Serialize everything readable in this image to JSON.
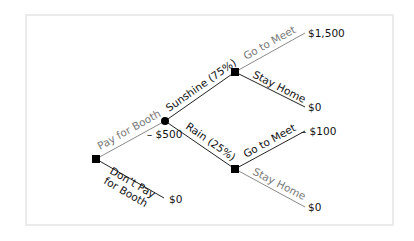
{
  "diagram": {
    "type": "decision-tree",
    "nodes": {
      "root": {
        "kind": "decision",
        "shape": "square"
      },
      "weather": {
        "kind": "chance",
        "shape": "circle"
      },
      "sunshine_choice": {
        "kind": "decision",
        "shape": "square"
      },
      "rain_choice": {
        "kind": "decision",
        "shape": "square"
      }
    },
    "branches": {
      "pay_for_booth": {
        "label": "Pay for Booth",
        "cost": "– $500",
        "color": "#7a7a7a"
      },
      "dont_pay": {
        "label_line1": "Don’t Pay",
        "label_line2": "for Booth",
        "payoff": "$0",
        "color": "#111111"
      },
      "sunshine": {
        "label": "Sunshine (75%)",
        "color": "#111111"
      },
      "rain": {
        "label": "Rain (25%)",
        "color": "#111111"
      },
      "sun_go": {
        "label": "Go to Meet",
        "payoff": "$1,500",
        "color": "#7a7a7a"
      },
      "sun_stay": {
        "label": "Stay Home",
        "payoff": "$0",
        "color": "#111111"
      },
      "rain_go": {
        "label": "Go to Meet",
        "payoff": "– $100",
        "color": "#111111"
      },
      "rain_stay": {
        "label": "Stay Home",
        "payoff": "$0",
        "color": "#7a7a7a"
      }
    }
  }
}
